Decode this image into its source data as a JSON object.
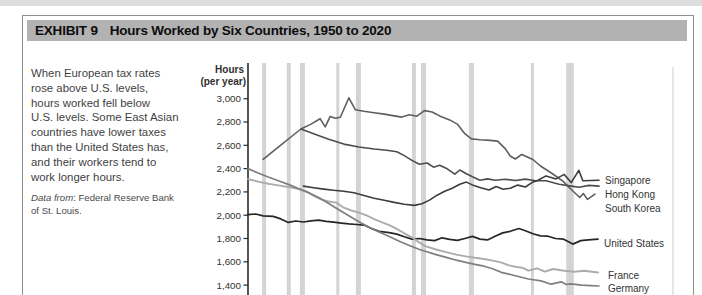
{
  "page": {
    "top_strip_color": "#d2d2d2"
  },
  "exhibit": {
    "label": "EXHIBIT 9",
    "title": "Hours Worked by Six Countries, 1950 to 2020",
    "titlebar_bg": "#b2b2b2"
  },
  "sidebar": {
    "paragraph": "When European tax rates\nrose above U.S. levels,\nhours worked fell below\nU.S. levels. Some East Asian\ncountries have lower taxes\nthan the United States has,\nand their workers tend to\nwork longer hours.",
    "source_prefix": "Data from",
    "source_rest_line1": ": Federal Reserve Bank",
    "source_line2": "of St. Louis."
  },
  "chart_data": {
    "type": "line",
    "title": "Hours Worked by Six Countries, 1950 to 2020",
    "ylabel_line1": "Hours",
    "ylabel_line2": "(per year)",
    "xlabel": "",
    "x_range_years": [
      1950,
      2020
    ],
    "ylim": [
      1300,
      3060
    ],
    "yticks": [
      3000,
      2800,
      2600,
      2400,
      2200,
      2000,
      1800,
      1600,
      1400
    ],
    "ytick_labels": [
      "3,000",
      "2,800",
      "2,600",
      "2,400",
      "2,200",
      "2,000",
      "1,800",
      "1,600",
      "1,400"
    ],
    "grid": false,
    "x_axis_labels_visible": false,
    "legend_position": "right-end-labels",
    "axis_color": "#2b2b2b",
    "band_color": "#d4d4d4",
    "recession_bands_years": [
      [
        1952.8,
        1953.6
      ],
      [
        1957.7,
        1958.5
      ],
      [
        1960.3,
        1961.3
      ],
      [
        1967.5,
        1968.1
      ],
      [
        1971.4,
        1972.4
      ],
      [
        1982.5,
        1983.3
      ],
      [
        1984.3,
        1985.3
      ],
      [
        1993.8,
        1994.8
      ],
      [
        2006.1,
        2006.7
      ],
      [
        2013.1,
        2014.6
      ]
    ],
    "faint_vertical_line_x_px": 672,
    "series": [
      {
        "name": "South Korea",
        "label": "South Korea",
        "color": "#5e5e5e",
        "width": 1.6,
        "label_px": [
          604,
          211
        ],
        "points": [
          [
            1953,
            2480
          ],
          [
            1956,
            2584
          ],
          [
            1958.5,
            2671
          ],
          [
            1960.5,
            2740
          ],
          [
            1962.5,
            2782
          ],
          [
            1964.3,
            2828
          ],
          [
            1965.3,
            2758
          ],
          [
            1966.3,
            2848
          ],
          [
            1967.3,
            2832
          ],
          [
            1968.3,
            2840
          ],
          [
            1970,
            3008
          ],
          [
            1971.3,
            2905
          ],
          [
            1973,
            2892
          ],
          [
            1975,
            2880
          ],
          [
            1977,
            2868
          ],
          [
            1979,
            2852
          ],
          [
            1980.5,
            2842
          ],
          [
            1982,
            2862
          ],
          [
            1983.5,
            2850
          ],
          [
            1985,
            2898
          ],
          [
            1986.5,
            2886
          ],
          [
            1988,
            2852
          ],
          [
            1990,
            2818
          ],
          [
            1991.5,
            2782
          ],
          [
            1993,
            2700
          ],
          [
            1994.3,
            2655
          ],
          [
            1996,
            2648
          ],
          [
            1998,
            2642
          ],
          [
            1999.5,
            2636
          ],
          [
            2001,
            2572
          ],
          [
            2002,
            2508
          ],
          [
            2003,
            2482
          ],
          [
            2004.3,
            2522
          ],
          [
            2005.5,
            2498
          ],
          [
            2006.5,
            2478
          ],
          [
            2008,
            2422
          ],
          [
            2010.3,
            2358
          ],
          [
            2012.5,
            2290
          ],
          [
            2014.3,
            2212
          ],
          [
            2015.8,
            2152
          ],
          [
            2016.5,
            2186
          ],
          [
            2017.3,
            2136
          ],
          [
            2018.8,
            2180
          ]
        ]
      },
      {
        "name": "Hong Kong",
        "label": "Hong Kong",
        "color": "#4d4d4d",
        "width": 1.6,
        "label_px": [
          604,
          197
        ],
        "points": [
          [
            1960.5,
            2740
          ],
          [
            1963,
            2700
          ],
          [
            1966,
            2652
          ],
          [
            1969,
            2610
          ],
          [
            1972,
            2585
          ],
          [
            1975,
            2568
          ],
          [
            1977.5,
            2558
          ],
          [
            1979.5,
            2545
          ],
          [
            1981,
            2512
          ],
          [
            1982.5,
            2470
          ],
          [
            1984,
            2438
          ],
          [
            1985.5,
            2448
          ],
          [
            1986.8,
            2412
          ],
          [
            1988,
            2428
          ],
          [
            1989.5,
            2398
          ],
          [
            1991,
            2352
          ],
          [
            1992,
            2388
          ],
          [
            1993.2,
            2358
          ],
          [
            1994.5,
            2330
          ],
          [
            1996,
            2300
          ],
          [
            1997.5,
            2312
          ],
          [
            1999,
            2300
          ],
          [
            2001,
            2308
          ],
          [
            2003,
            2298
          ],
          [
            2005,
            2310
          ],
          [
            2007,
            2296
          ],
          [
            2009.1,
            2295
          ],
          [
            2011.7,
            2265
          ],
          [
            2014.1,
            2250
          ],
          [
            2015.7,
            2240
          ],
          [
            2017.6,
            2256
          ],
          [
            2019.6,
            2250
          ]
        ]
      },
      {
        "name": "Singapore",
        "label": "Singapore",
        "color": "#3c3c3c",
        "width": 1.6,
        "label_px": [
          604,
          183
        ],
        "points": [
          [
            1961,
            2250
          ],
          [
            1963,
            2236
          ],
          [
            1965,
            2224
          ],
          [
            1967,
            2214
          ],
          [
            1969,
            2206
          ],
          [
            1971,
            2192
          ],
          [
            1973,
            2168
          ],
          [
            1975,
            2145
          ],
          [
            1977,
            2128
          ],
          [
            1979,
            2110
          ],
          [
            1981,
            2094
          ],
          [
            1983,
            2084
          ],
          [
            1984.5,
            2098
          ],
          [
            1986,
            2130
          ],
          [
            1987.5,
            2172
          ],
          [
            1989,
            2205
          ],
          [
            1990.5,
            2232
          ],
          [
            1992,
            2266
          ],
          [
            1993.3,
            2284
          ],
          [
            1994.8,
            2254
          ],
          [
            1996.3,
            2234
          ],
          [
            1997.8,
            2216
          ],
          [
            1999.2,
            2246
          ],
          [
            2000.6,
            2222
          ],
          [
            2002,
            2232
          ],
          [
            2003.5,
            2258
          ],
          [
            2005,
            2242
          ],
          [
            2006.3,
            2280
          ],
          [
            2007.5,
            2300
          ],
          [
            2009.1,
            2337
          ],
          [
            2011.1,
            2312
          ],
          [
            2012.7,
            2350
          ],
          [
            2014.1,
            2280
          ],
          [
            2015.6,
            2385
          ],
          [
            2016.4,
            2295
          ],
          [
            2018,
            2298
          ],
          [
            2019.6,
            2300
          ]
        ]
      },
      {
        "name": "United States",
        "label": "United States",
        "color": "#262626",
        "width": 1.7,
        "label_px": [
          603,
          246
        ],
        "points": [
          [
            1950,
            2005
          ],
          [
            1951.5,
            2010
          ],
          [
            1953,
            1995
          ],
          [
            1955,
            1990
          ],
          [
            1956.5,
            1968
          ],
          [
            1958,
            1938
          ],
          [
            1959.5,
            1950
          ],
          [
            1961,
            1942
          ],
          [
            1962.5,
            1952
          ],
          [
            1964,
            1958
          ],
          [
            1965.5,
            1948
          ],
          [
            1967,
            1940
          ],
          [
            1968.5,
            1932
          ],
          [
            1970,
            1925
          ],
          [
            1971.5,
            1920
          ],
          [
            1973,
            1915
          ],
          [
            1974.5,
            1885
          ],
          [
            1976,
            1862
          ],
          [
            1978,
            1850
          ],
          [
            1979.5,
            1838
          ],
          [
            1981,
            1815
          ],
          [
            1982.5,
            1795
          ],
          [
            1984,
            1800
          ],
          [
            1985.5,
            1788
          ],
          [
            1987,
            1782
          ],
          [
            1988.5,
            1806
          ],
          [
            1990,
            1792
          ],
          [
            1991.5,
            1784
          ],
          [
            1993,
            1800
          ],
          [
            1994.5,
            1818
          ],
          [
            1996,
            1795
          ],
          [
            1997.5,
            1788
          ],
          [
            1999,
            1820
          ],
          [
            2000.5,
            1848
          ],
          [
            2002,
            1862
          ],
          [
            2003.7,
            1886
          ],
          [
            2005,
            1866
          ],
          [
            2006.5,
            1840
          ],
          [
            2008,
            1822
          ],
          [
            2009.5,
            1820
          ],
          [
            2011,
            1800
          ],
          [
            2012.5,
            1795
          ],
          [
            2014.4,
            1752
          ],
          [
            2016,
            1782
          ],
          [
            2017.5,
            1788
          ],
          [
            2019.4,
            1795
          ]
        ]
      },
      {
        "name": "France",
        "label": "France",
        "color": "#a9aea9",
        "width": 1.9,
        "label_px": [
          607,
          278
        ],
        "points": [
          [
            1950,
            2310
          ],
          [
            1952,
            2288
          ],
          [
            1954,
            2270
          ],
          [
            1956,
            2256
          ],
          [
            1958,
            2242
          ],
          [
            1960,
            2226
          ],
          [
            1961.5,
            2205
          ],
          [
            1963,
            2165
          ],
          [
            1964.5,
            2136
          ],
          [
            1966,
            2118
          ],
          [
            1967.5,
            2108
          ],
          [
            1969,
            2064
          ],
          [
            1970.5,
            2040
          ],
          [
            1972,
            2022
          ],
          [
            1973.5,
            1998
          ],
          [
            1975,
            1966
          ],
          [
            1976.5,
            1940
          ],
          [
            1978,
            1914
          ],
          [
            1979.5,
            1882
          ],
          [
            1981,
            1845
          ],
          [
            1982.5,
            1810
          ],
          [
            1984,
            1765
          ],
          [
            1985.3,
            1732
          ],
          [
            1987.3,
            1706
          ],
          [
            1989.3,
            1682
          ],
          [
            1991.3,
            1662
          ],
          [
            1993.2,
            1646
          ],
          [
            1995,
            1634
          ],
          [
            1996.8,
            1624
          ],
          [
            1998.8,
            1608
          ],
          [
            2000.3,
            1592
          ],
          [
            2001.6,
            1572
          ],
          [
            2003,
            1558
          ],
          [
            2004.5,
            1548
          ],
          [
            2005.6,
            1524
          ],
          [
            2007.3,
            1544
          ],
          [
            2008.9,
            1515
          ],
          [
            2010.5,
            1538
          ],
          [
            2012.7,
            1524
          ],
          [
            2014.7,
            1514
          ],
          [
            2016.6,
            1524
          ],
          [
            2019.4,
            1508
          ]
        ]
      },
      {
        "name": "Germany",
        "label": "Germany",
        "color": "#7f7f7f",
        "width": 1.7,
        "label_px": [
          607,
          291
        ],
        "points": [
          [
            1950,
            2400
          ],
          [
            1952,
            2362
          ],
          [
            1954,
            2328
          ],
          [
            1956,
            2296
          ],
          [
            1958,
            2264
          ],
          [
            1960,
            2228
          ],
          [
            1962,
            2194
          ],
          [
            1964,
            2152
          ],
          [
            1966,
            2100
          ],
          [
            1968,
            2046
          ],
          [
            1970,
            1996
          ],
          [
            1972,
            1944
          ],
          [
            1974,
            1896
          ],
          [
            1976,
            1856
          ],
          [
            1978,
            1816
          ],
          [
            1980,
            1776
          ],
          [
            1982,
            1740
          ],
          [
            1984,
            1706
          ],
          [
            1985.3,
            1688
          ],
          [
            1987.3,
            1662
          ],
          [
            1989.3,
            1638
          ],
          [
            1991.3,
            1614
          ],
          [
            1993.2,
            1596
          ],
          [
            1995,
            1578
          ],
          [
            1996.8,
            1562
          ],
          [
            1998.5,
            1540
          ],
          [
            2000.2,
            1510
          ],
          [
            2002.8,
            1482
          ],
          [
            2005.6,
            1452
          ],
          [
            2008.1,
            1436
          ],
          [
            2010.1,
            1408
          ],
          [
            2012.1,
            1428
          ],
          [
            2013.1,
            1406
          ],
          [
            2014.1,
            1410
          ],
          [
            2016.1,
            1400
          ],
          [
            2018,
            1396
          ],
          [
            2019.6,
            1392
          ]
        ]
      }
    ]
  }
}
